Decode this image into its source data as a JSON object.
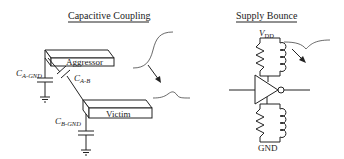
{
  "left_panel": {
    "title": "Capacitive Coupling",
    "aggressor_label": "Aggressor",
    "victim_label": "Victim",
    "cap_a_gnd": {
      "main": "C",
      "sub": "A-GND"
    },
    "cap_a_b": {
      "main": "C",
      "sub": "A-B"
    },
    "cap_b_gnd": {
      "main": "C",
      "sub": "B-GND"
    }
  },
  "right_panel": {
    "title": "Supply Bounce",
    "vdd_label": {
      "main": "V",
      "sub": "DD"
    },
    "gnd_label": "GND"
  }
}
